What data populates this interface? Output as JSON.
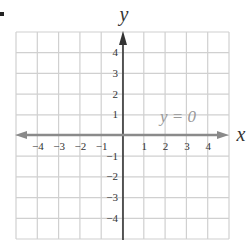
{
  "problem": {
    "bullet": "•"
  },
  "chart_data": {
    "type": "line",
    "title": "",
    "equation_label": "y = 0",
    "xlabel": "x",
    "ylabel": "y",
    "xlim": [
      -4.8,
      5.2
    ],
    "ylim": [
      -4.8,
      5.0
    ],
    "grid": true,
    "x_ticks": [
      -4,
      -3,
      -2,
      -1,
      1,
      2,
      3,
      4
    ],
    "x_tick_labels": [
      "−4",
      "−3",
      "−2",
      "−1",
      "1",
      "2",
      "3",
      "4"
    ],
    "y_ticks": [
      4,
      3,
      2,
      1,
      -1,
      -2,
      -3,
      -4
    ],
    "y_tick_labels": [
      "4",
      "3",
      "2",
      "1",
      "−1",
      "−2",
      "−3",
      "−4"
    ],
    "series": [
      {
        "name": "y = 0",
        "x": [
          -5,
          5
        ],
        "y": [
          0,
          0
        ],
        "color": "#8a8a8a",
        "arrows": "both"
      }
    ],
    "colors": {
      "grid": "#d0d0d0",
      "axis": "#333333",
      "line": "#8a8a8a",
      "label": "#999999",
      "text": "#333333"
    }
  }
}
